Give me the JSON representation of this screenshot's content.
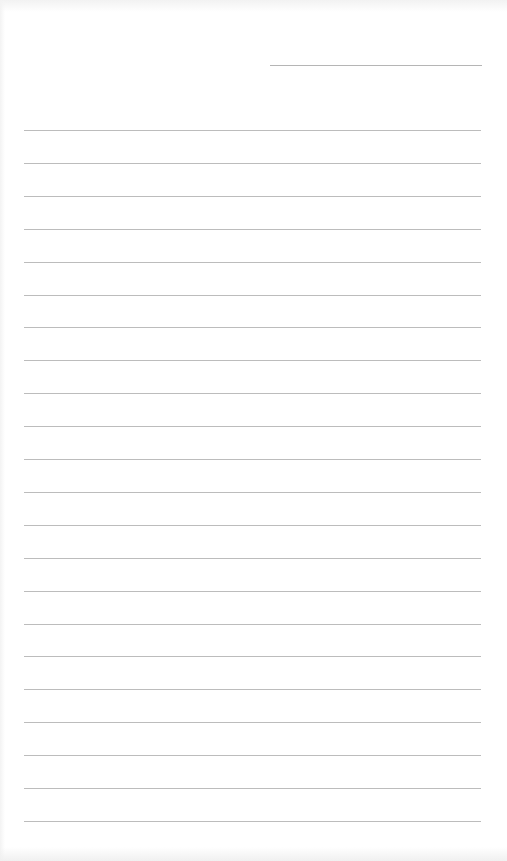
{
  "page": {
    "type": "blank ruled sheet",
    "background": "#ffffff",
    "line_color": "#bcbcbc"
  },
  "date_line": {
    "x1": 270,
    "x2": 482,
    "y": 65
  },
  "ruled_lines": {
    "count": 22,
    "x1": 24,
    "x2": 481,
    "first_y": 130,
    "spacing": 32.9
  }
}
